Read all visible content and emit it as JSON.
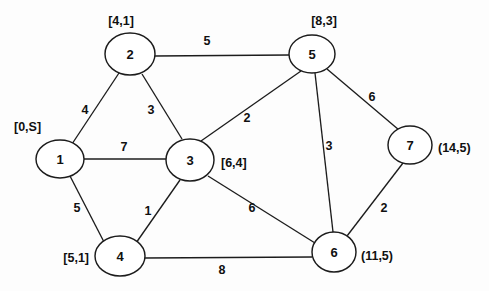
{
  "diagram": {
    "type": "node-link-graph",
    "width": 489,
    "height": 291,
    "background_color": "#fdfdfd",
    "stroke_color": "#1c1c1c",
    "text_color": "#101010"
  },
  "graph_data": {
    "type": "graph",
    "directed": false,
    "weighted": true,
    "source_node": "1",
    "label_format": "[distance,predecessor] where S marks the source; parentheses mark tentative/unfinalized labels",
    "nodes": [
      {
        "id": "1",
        "label": "1",
        "annotation": "[0,S]",
        "annotation_bracket": "square",
        "distance": 0,
        "predecessor": "S",
        "cx": 60,
        "cy": 159,
        "rx": 24,
        "ry": 19,
        "anno_x": 14,
        "anno_y": 127,
        "anno_anchor": "start"
      },
      {
        "id": "2",
        "label": "2",
        "annotation": "[4,1]",
        "annotation_bracket": "square",
        "distance": 4,
        "predecessor": "1",
        "cx": 130,
        "cy": 54,
        "rx": 25,
        "ry": 21,
        "anno_x": 121,
        "anno_y": 21,
        "anno_anchor": "middle"
      },
      {
        "id": "3",
        "label": "3",
        "annotation": "[6,4]",
        "annotation_bracket": "square",
        "distance": 6,
        "predecessor": "4",
        "cx": 190,
        "cy": 160,
        "rx": 24,
        "ry": 21,
        "anno_x": 221,
        "anno_y": 163,
        "anno_anchor": "start"
      },
      {
        "id": "4",
        "label": "4",
        "annotation": "[5,1]",
        "annotation_bracket": "square",
        "distance": 5,
        "predecessor": "1",
        "cx": 120,
        "cy": 256,
        "rx": 25,
        "ry": 20,
        "anno_x": 89,
        "anno_y": 258,
        "anno_anchor": "end"
      },
      {
        "id": "5",
        "label": "5",
        "annotation": "[8,3]",
        "annotation_bracket": "square",
        "distance": 8,
        "predecessor": "3",
        "cx": 312,
        "cy": 54,
        "rx": 23,
        "ry": 19,
        "anno_x": 324,
        "anno_y": 21,
        "anno_anchor": "middle"
      },
      {
        "id": "6",
        "label": "6",
        "annotation": "(11,5)",
        "annotation_bracket": "round",
        "distance": 11,
        "predecessor": "5",
        "cx": 334,
        "cy": 252,
        "rx": 22,
        "ry": 20,
        "anno_x": 361,
        "anno_y": 256,
        "anno_anchor": "start"
      },
      {
        "id": "7",
        "label": "7",
        "annotation": "(14,5)",
        "annotation_bracket": "round",
        "distance": 14,
        "predecessor": "5",
        "cx": 410,
        "cy": 145,
        "rx": 22,
        "ry": 19,
        "anno_x": 438,
        "anno_y": 148,
        "anno_anchor": "start"
      }
    ],
    "edges": [
      {
        "from": "1",
        "to": "2",
        "weight": "4",
        "x1": 72,
        "y1": 144,
        "x2": 119,
        "y2": 73,
        "label_x": 85,
        "label_y": 110
      },
      {
        "from": "1",
        "to": "3",
        "weight": "7",
        "x1": 84,
        "y1": 159,
        "x2": 166,
        "y2": 159,
        "label_x": 124,
        "label_y": 147
      },
      {
        "from": "1",
        "to": "4",
        "weight": "5",
        "x1": 70,
        "y1": 176,
        "x2": 104,
        "y2": 242,
        "label_x": 77,
        "label_y": 208
      },
      {
        "from": "2",
        "to": "5",
        "weight": "5",
        "x1": 155,
        "y1": 56,
        "x2": 289,
        "y2": 55,
        "label_x": 207,
        "label_y": 41
      },
      {
        "from": "2",
        "to": "3",
        "weight": "3",
        "x1": 142,
        "y1": 74,
        "x2": 182,
        "y2": 139,
        "label_x": 151,
        "label_y": 110
      },
      {
        "from": "3",
        "to": "5",
        "weight": "2",
        "x1": 201,
        "y1": 141,
        "x2": 301,
        "y2": 71,
        "label_x": 247,
        "label_y": 118
      },
      {
        "from": "3",
        "to": "4",
        "weight": "1",
        "x1": 180,
        "y1": 180,
        "x2": 136,
        "y2": 243,
        "label_x": 148,
        "label_y": 211
      },
      {
        "from": "3",
        "to": "6",
        "weight": "6",
        "x1": 208,
        "y1": 176,
        "x2": 315,
        "y2": 243,
        "label_x": 252,
        "label_y": 208
      },
      {
        "from": "5",
        "to": "6",
        "weight": "3",
        "x1": 315,
        "y1": 73,
        "x2": 333,
        "y2": 232,
        "label_x": 329,
        "label_y": 146
      },
      {
        "from": "5",
        "to": "7",
        "weight": "6",
        "x1": 327,
        "y1": 69,
        "x2": 399,
        "y2": 130,
        "label_x": 372,
        "label_y": 97
      },
      {
        "from": "6",
        "to": "7",
        "weight": "2",
        "x1": 347,
        "y1": 236,
        "x2": 403,
        "y2": 163,
        "label_x": 384,
        "label_y": 208
      },
      {
        "from": "4",
        "to": "6",
        "weight": "8",
        "x1": 145,
        "y1": 258,
        "x2": 312,
        "y2": 257,
        "label_x": 222,
        "label_y": 270
      }
    ]
  }
}
